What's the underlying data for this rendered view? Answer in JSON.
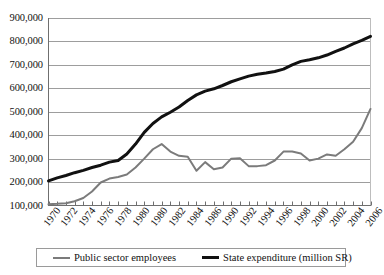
{
  "chart_data": {
    "type": "line",
    "title": "",
    "xlabel": "",
    "ylabel": "",
    "ylim": [
      100000,
      900000
    ],
    "xlim": [
      1970,
      2007
    ],
    "grid": true,
    "legend_position": "bottom",
    "ytick_labels": [
      "900,000",
      "800,000",
      "700,000",
      "600,000",
      "500,000",
      "400,000",
      "300,000",
      "200,000",
      "100,000"
    ],
    "ytick_values": [
      900000,
      800000,
      700000,
      600000,
      500000,
      400000,
      300000,
      200000,
      100000
    ],
    "xtick_labels": [
      "1970",
      "1972",
      "1974",
      "1976",
      "1978",
      "1980",
      "1980",
      "1982",
      "1984",
      "1986",
      "1990",
      "1992",
      "1994",
      "1996",
      "1998",
      "2000",
      "2002",
      "2004",
      "2006"
    ],
    "x": [
      1970,
      1971,
      1972,
      1973,
      1974,
      1975,
      1976,
      1977,
      1978,
      1979,
      1980,
      1981,
      1982,
      1983,
      1984,
      1985,
      1986,
      1987,
      1988,
      1989,
      1990,
      1991,
      1992,
      1993,
      1994,
      1995,
      1996,
      1997,
      1998,
      1999,
      2000,
      2001,
      2002,
      2003,
      2004,
      2005,
      2006,
      2007
    ],
    "series": [
      {
        "name": "Public sector employees",
        "color": "#7b7b7b",
        "width": 2,
        "values": [
          105000,
          107000,
          110000,
          118000,
          132000,
          160000,
          198000,
          215000,
          222000,
          232000,
          262000,
          300000,
          340000,
          362000,
          330000,
          312000,
          308000,
          248000,
          285000,
          255000,
          262000,
          300000,
          302000,
          268000,
          268000,
          272000,
          292000,
          330000,
          330000,
          322000,
          292000,
          300000,
          318000,
          312000,
          340000,
          372000,
          430000,
          512000
        ]
      },
      {
        "name": "State expenditure (million SR)",
        "color": "#111111",
        "width": 3,
        "values": [
          205000,
          218000,
          228000,
          240000,
          250000,
          262000,
          272000,
          285000,
          292000,
          320000,
          362000,
          412000,
          450000,
          478000,
          498000,
          520000,
          548000,
          572000,
          588000,
          598000,
          612000,
          628000,
          640000,
          652000,
          660000,
          665000,
          672000,
          682000,
          700000,
          715000,
          722000,
          730000,
          742000,
          758000,
          772000,
          790000,
          805000,
          822000
        ]
      }
    ]
  },
  "legend": {
    "items": [
      {
        "label": "Public sector employees",
        "swatch": "grey-line-swatch"
      },
      {
        "label": "State expenditure (million SR)",
        "swatch": "black-line-swatch"
      }
    ]
  }
}
